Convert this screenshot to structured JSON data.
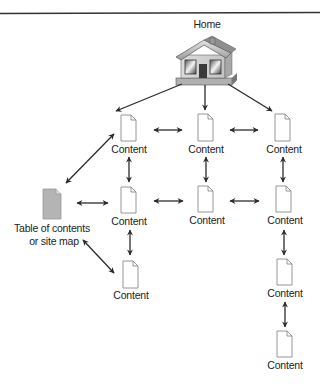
{
  "diagram": {
    "type": "site-structure",
    "top_rule": true,
    "colors": {
      "line": "#2a2a2a",
      "doc_outline": "#8a8a8a",
      "doc_fill": "#ffffff",
      "toc_fill": "#b4b4b4",
      "label": "#222222"
    },
    "home": {
      "label": "Home",
      "icon": "house-icon"
    },
    "toc": {
      "label_line1": "Table of contents",
      "label_line2": "or site map",
      "icon": "document-gray-icon"
    },
    "content_label": "Content",
    "nodes": [
      {
        "id": "c1",
        "label": "Content",
        "col": 1,
        "row": 1
      },
      {
        "id": "c2",
        "label": "Content",
        "col": 2,
        "row": 1
      },
      {
        "id": "c3",
        "label": "Content",
        "col": 3,
        "row": 1
      },
      {
        "id": "c4",
        "label": "Content",
        "col": 1,
        "row": 2
      },
      {
        "id": "c5",
        "label": "Content",
        "col": 2,
        "row": 2
      },
      {
        "id": "c6",
        "label": "Content",
        "col": 3,
        "row": 2
      },
      {
        "id": "c7",
        "label": "Content",
        "col": 1,
        "row": 3
      },
      {
        "id": "c8",
        "label": "Content",
        "col": 3,
        "row": 3
      },
      {
        "id": "c9",
        "label": "Content",
        "col": 3,
        "row": 4
      }
    ],
    "edges": [
      {
        "from": "home",
        "to": "c1",
        "type": "one-way"
      },
      {
        "from": "home",
        "to": "c2",
        "type": "one-way"
      },
      {
        "from": "home",
        "to": "c3",
        "type": "one-way"
      },
      {
        "from": "c1",
        "to": "c2",
        "type": "two-way"
      },
      {
        "from": "c2",
        "to": "c3",
        "type": "two-way"
      },
      {
        "from": "c1",
        "to": "c4",
        "type": "two-way"
      },
      {
        "from": "c2",
        "to": "c5",
        "type": "two-way"
      },
      {
        "from": "c3",
        "to": "c6",
        "type": "two-way"
      },
      {
        "from": "c4",
        "to": "c5",
        "type": "two-way"
      },
      {
        "from": "c5",
        "to": "c6",
        "type": "two-way"
      },
      {
        "from": "c4",
        "to": "c7",
        "type": "two-way"
      },
      {
        "from": "c6",
        "to": "c8",
        "type": "two-way"
      },
      {
        "from": "c8",
        "to": "c9",
        "type": "two-way"
      },
      {
        "from": "toc",
        "to": "c1",
        "type": "two-way"
      },
      {
        "from": "toc",
        "to": "c4",
        "type": "two-way"
      },
      {
        "from": "toc",
        "to": "c7",
        "type": "two-way"
      }
    ]
  }
}
